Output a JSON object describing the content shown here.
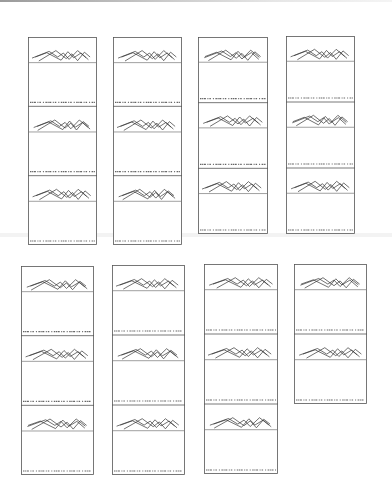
{
  "page": {
    "type": "scanned-document",
    "background": "#ffffff",
    "ink_color": "#333333",
    "frame_color": "#555555"
  },
  "panels": [
    {
      "id": 1,
      "x": 28,
      "y": 37,
      "w": 69,
      "h": 208,
      "strips": 3,
      "caption": "................ .. ... .. ... ... .. . ."
    },
    {
      "id": 2,
      "x": 113,
      "y": 37,
      "w": 69,
      "h": 208,
      "strips": 3,
      "caption": "................ .. ... .. ... ... .. . ."
    },
    {
      "id": 3,
      "x": 198,
      "y": 37,
      "w": 70,
      "h": 197,
      "strips": 3,
      "caption": "................ .. ... .. ... ... .. . ."
    },
    {
      "id": 4,
      "x": 286,
      "y": 36,
      "w": 69,
      "h": 198,
      "strips": 3,
      "caption": "................ .. ... .. ... ... .. . ."
    },
    {
      "id": 5,
      "x": 21,
      "y": 266,
      "w": 73,
      "h": 209,
      "strips": 3,
      "caption": "................ .. ... .. ... ... .. . ."
    },
    {
      "id": 6,
      "x": 112,
      "y": 265,
      "w": 73,
      "h": 210,
      "strips": 3,
      "caption": "................ .. ... .. ... ... .. . ."
    },
    {
      "id": 7,
      "x": 204,
      "y": 264,
      "w": 74,
      "h": 210,
      "strips": 3,
      "caption": "................ .. ... .. ... ... .. . ."
    },
    {
      "id": 8,
      "x": 294,
      "y": 264,
      "w": 73,
      "h": 140,
      "strips": 2,
      "caption": "................ .. ... .. ... ... .. . ."
    }
  ],
  "waveform": {
    "description": "Overlaid zig-zag peak traces crossing a horizontal baseline",
    "baseline_ratio": 0.46,
    "traces": [
      [
        [
          0.0,
          0.62
        ],
        [
          0.3,
          0.2
        ],
        [
          0.45,
          0.55
        ],
        [
          0.55,
          0.3
        ],
        [
          0.65,
          0.7
        ],
        [
          0.8,
          0.15
        ],
        [
          0.95,
          0.6
        ]
      ],
      [
        [
          0.05,
          0.55
        ],
        [
          0.25,
          0.28
        ],
        [
          0.5,
          0.75
        ],
        [
          0.62,
          0.22
        ],
        [
          0.72,
          0.6
        ],
        [
          0.85,
          0.3
        ],
        [
          0.98,
          0.72
        ]
      ],
      [
        [
          0.1,
          0.8
        ],
        [
          0.4,
          0.15
        ],
        [
          0.58,
          0.65
        ],
        [
          0.68,
          0.35
        ],
        [
          0.78,
          0.78
        ],
        [
          0.9,
          0.25
        ],
        [
          1.0,
          0.55
        ]
      ]
    ]
  }
}
